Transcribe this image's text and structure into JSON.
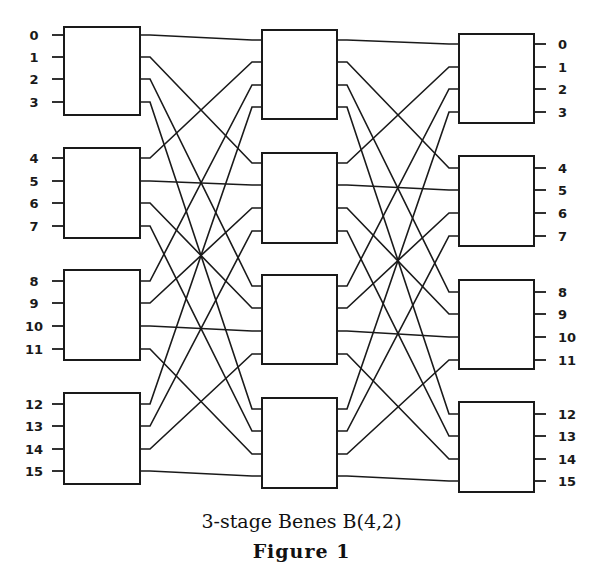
{
  "figure": {
    "caption": "3-stage Benes B(4,2)",
    "figure_label": "Figure  1"
  },
  "network": {
    "stages": 3,
    "switches_per_stage": 4,
    "ports_per_switch": 4,
    "input_labels": [
      "0",
      "1",
      "2",
      "3",
      "4",
      "5",
      "6",
      "7",
      "8",
      "9",
      "10",
      "11",
      "12",
      "13",
      "14",
      "15"
    ],
    "output_labels": [
      "0",
      "1",
      "2",
      "3",
      "4",
      "5",
      "6",
      "7",
      "8",
      "9",
      "10",
      "11",
      "12",
      "13",
      "14",
      "15"
    ],
    "interconnection": "output port j of switch i connects to input port i of next-stage switch j",
    "line_color": "#1a1a1a",
    "background": "#ffffff"
  }
}
